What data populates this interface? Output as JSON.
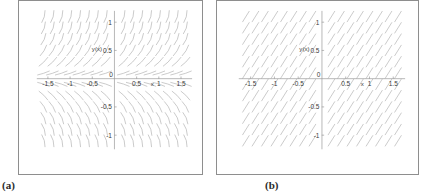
{
  "figure": {
    "panels": [
      {
        "id": "a",
        "caption": "(a)",
        "field_style": "curved",
        "axis": {
          "xlabel": "x",
          "ylabel": "y(x)",
          "xticks": [
            "-1.5",
            "-1",
            "-0.5",
            "0",
            "0.5",
            "1",
            "1.5"
          ],
          "xtick_values": [
            -1.5,
            -1,
            -0.5,
            0,
            0.5,
            1,
            1.5
          ],
          "yticks": [
            "-1",
            "-0.5",
            "0.5",
            "1"
          ],
          "ytick_values": [
            -1,
            -0.5,
            0.5,
            1
          ],
          "xlim": [
            -1.75,
            1.75
          ],
          "ylim": [
            -1.25,
            1.2
          ]
        }
      },
      {
        "id": "b",
        "caption": "(b)",
        "field_style": "straight",
        "axis": {
          "xlabel": "x",
          "ylabel": "y(x)",
          "xticks": [
            "-1.5",
            "-1",
            "-0.5",
            "0",
            "0.5",
            "1",
            "1.5"
          ],
          "xtick_values": [
            -1.5,
            -1,
            -0.5,
            0,
            0.5,
            1,
            1.5
          ],
          "yticks": [
            "-1",
            "-0.5",
            "0.5",
            "1"
          ],
          "ytick_values": [
            -1,
            -0.5,
            0.5,
            1
          ],
          "xlim": [
            -1.75,
            1.75
          ],
          "ylim": [
            -1.25,
            1.2
          ]
        }
      }
    ]
  },
  "chart_data": [
    {
      "type": "scatter",
      "subtype": "slope-field",
      "panel": "a",
      "title": "",
      "xlabel": "x",
      "ylabel": "y(x)",
      "xlim": [
        -1.75,
        1.75
      ],
      "ylim": [
        -1.25,
        1.2
      ],
      "xticks": [
        -1.5,
        -1,
        -0.5,
        0,
        0.5,
        1,
        1.5
      ],
      "xticklabels": [
        "-1.5",
        "-1",
        "-0.5",
        "0",
        "0.5",
        "1",
        "1.5"
      ],
      "yticks": [
        -1,
        -0.5,
        0.5,
        1
      ],
      "yticklabels": [
        "-1",
        "-0.5",
        "0.5",
        "1"
      ],
      "grid": false,
      "legend": null,
      "annotations": [
        "(a)"
      ],
      "description": "Direction field of slanted curved dashes; slope magnitude grows with |y| and strokes tilt right-upward, nearly horizontal near y=0.",
      "slope_expression": "dy/dx proportional to y",
      "stroke_color": "#b9b9b9",
      "axis_color": "#9a9a9a",
      "grid_x": [
        -1.6,
        -1.4,
        -1.2,
        -1.0,
        -0.8,
        -0.6,
        -0.4,
        -0.2,
        0.2,
        0.4,
        0.6,
        0.8,
        1.0,
        1.2,
        1.4,
        1.6
      ],
      "grid_y": [
        -1.1,
        -0.9,
        -0.7,
        -0.5,
        -0.3,
        -0.1,
        0.1,
        0.3,
        0.5,
        0.7,
        0.9,
        1.1
      ]
    },
    {
      "type": "scatter",
      "subtype": "slope-field",
      "panel": "b",
      "title": "",
      "xlabel": "x",
      "ylabel": "y(x)",
      "xlim": [
        -1.75,
        1.75
      ],
      "ylim": [
        -1.25,
        1.2
      ],
      "xticks": [
        -1.5,
        -1,
        -0.5,
        0,
        0.5,
        1,
        1.5
      ],
      "xticklabels": [
        "-1.5",
        "-1",
        "-0.5",
        "0",
        "0.5",
        "1",
        "1.5"
      ],
      "yticks": [
        -1,
        -0.5,
        0.5,
        1
      ],
      "yticklabels": [
        "-1",
        "-0.5",
        "0.5",
        "1"
      ],
      "grid": false,
      "legend": null,
      "annotations": [
        "(b)"
      ],
      "description": "Direction field of uniformly slanted straight dashes, constant positive slope across the whole plane.",
      "slope_expression": "dy/dx constant positive",
      "stroke_color": "#b9b9b9",
      "axis_color": "#9a9a9a",
      "grid_x": [
        -1.6,
        -1.4,
        -1.2,
        -1.0,
        -0.8,
        -0.6,
        -0.4,
        -0.2,
        0.2,
        0.4,
        0.6,
        0.8,
        1.0,
        1.2,
        1.4,
        1.6
      ],
      "grid_y": [
        -1.1,
        -0.9,
        -0.7,
        -0.5,
        -0.3,
        -0.1,
        0.1,
        0.3,
        0.5,
        0.7,
        0.9,
        1.1
      ]
    }
  ]
}
